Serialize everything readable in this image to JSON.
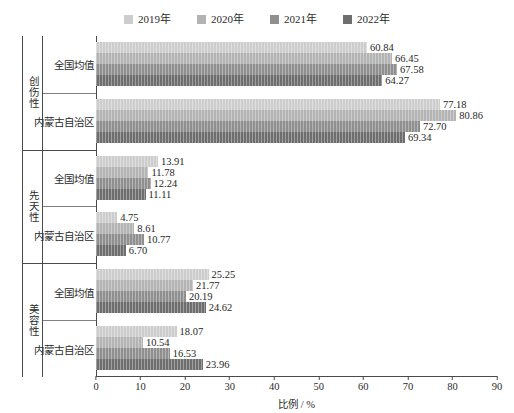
{
  "chart_data": {
    "type": "bar",
    "orientation": "horizontal",
    "title": "",
    "xlabel": "比例 / %",
    "ylabel": "",
    "xlim": [
      0,
      90
    ],
    "xticks": [
      0,
      10,
      20,
      30,
      40,
      50,
      60,
      70,
      80,
      90
    ],
    "grid": false,
    "legend_position": "top-center",
    "series": [
      {
        "name": "2019年",
        "color": "#cdcdcd"
      },
      {
        "name": "2020年",
        "color": "#b3b3b3"
      },
      {
        "name": "2021年",
        "color": "#8f8f8f"
      },
      {
        "name": "2022年",
        "color": "#6e6e6e"
      }
    ],
    "groups": [
      {
        "name": "创伤性",
        "rows": [
          {
            "name": "全国均值",
            "values": [
              60.84,
              66.45,
              67.58,
              64.27
            ]
          },
          {
            "name": "内蒙古自治区",
            "values": [
              77.18,
              80.86,
              72.7,
              69.34
            ]
          }
        ]
      },
      {
        "name": "先天性",
        "rows": [
          {
            "name": "全国均值",
            "values": [
              13.91,
              11.78,
              12.24,
              11.11
            ]
          },
          {
            "name": "内蒙古自治区",
            "values": [
              4.75,
              8.61,
              10.77,
              6.7
            ]
          }
        ]
      },
      {
        "name": "美容性",
        "rows": [
          {
            "name": "全国均值",
            "values": [
              25.25,
              21.77,
              20.19,
              24.62
            ]
          },
          {
            "name": "内蒙古自治区",
            "values": [
              18.07,
              10.54,
              16.53,
              23.96
            ]
          }
        ]
      }
    ]
  }
}
